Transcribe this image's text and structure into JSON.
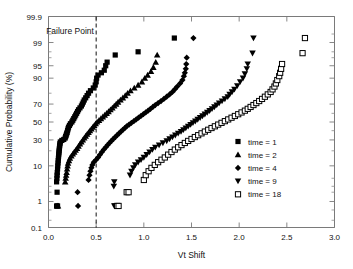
{
  "chart_data": {
    "type": "scatter",
    "title": "",
    "xlabel": "Vt Shift",
    "ylabel": "Cumulative Probability (%)",
    "xlim": [
      0.0,
      3.0
    ],
    "xticks": [
      0.0,
      0.5,
      1.0,
      1.5,
      2.0,
      2.5,
      3.0
    ],
    "xticklabels": [
      "0.0",
      "0.5",
      "1.0",
      "1.5",
      "2.0",
      "2.5",
      "3.0"
    ],
    "yscale": "normal-probability",
    "ylim": [
      0.1,
      99.9
    ],
    "yticks": [
      0.1,
      1,
      10,
      30,
      50,
      70,
      90,
      95,
      99,
      99.9
    ],
    "yticklabels": [
      "0.1",
      "1",
      "10",
      "30",
      "50",
      "70",
      "90",
      "95",
      "99",
      "99.9"
    ],
    "yminorticks": [
      0.2,
      0.5,
      2,
      3,
      5,
      20,
      40,
      60,
      80,
      97,
      98,
      99.5
    ],
    "grid": false,
    "legend_position": "right-lower",
    "annotations": [
      {
        "name": "failure-point",
        "text": "Failure Point",
        "x": 0.5,
        "line": "vertical-dashed",
        "line_style": "dashed"
      }
    ],
    "series": [
      {
        "name": "time = 1",
        "label": "time = 1",
        "marker": "filled-square",
        "color": "#000000",
        "points": [
          [
            0.085,
            0.7
          ],
          [
            0.095,
            0.7
          ],
          [
            0.09,
            2.0
          ],
          [
            0.085,
            4.0
          ],
          [
            0.088,
            5.0
          ],
          [
            0.09,
            6.0
          ],
          [
            0.092,
            7.0
          ],
          [
            0.095,
            8.5
          ],
          [
            0.097,
            10.0
          ],
          [
            0.1,
            11.5
          ],
          [
            0.102,
            13.0
          ],
          [
            0.104,
            14.5
          ],
          [
            0.106,
            16.0
          ],
          [
            0.108,
            17.5
          ],
          [
            0.11,
            19.0
          ],
          [
            0.112,
            20.5
          ],
          [
            0.114,
            22.0
          ],
          [
            0.116,
            23.5
          ],
          [
            0.118,
            25.0
          ],
          [
            0.12,
            26.5
          ],
          [
            0.124,
            28.0
          ],
          [
            0.14,
            29.5
          ],
          [
            0.16,
            30.5
          ],
          [
            0.175,
            32.0
          ],
          [
            0.18,
            33.5
          ],
          [
            0.185,
            35.0
          ],
          [
            0.19,
            36.5
          ],
          [
            0.195,
            38.0
          ],
          [
            0.2,
            40.0
          ],
          [
            0.205,
            42.0
          ],
          [
            0.21,
            44.0
          ],
          [
            0.22,
            46.0
          ],
          [
            0.23,
            48.0
          ],
          [
            0.245,
            50.0
          ],
          [
            0.255,
            52.0
          ],
          [
            0.265,
            54.0
          ],
          [
            0.275,
            56.0
          ],
          [
            0.285,
            58.0
          ],
          [
            0.295,
            60.0
          ],
          [
            0.305,
            62.0
          ],
          [
            0.315,
            64.0
          ],
          [
            0.33,
            66.0
          ],
          [
            0.345,
            68.0
          ],
          [
            0.355,
            70.0
          ],
          [
            0.365,
            72.0
          ],
          [
            0.375,
            74.0
          ],
          [
            0.39,
            76.0
          ],
          [
            0.405,
            78.0
          ],
          [
            0.42,
            80.0
          ],
          [
            0.44,
            82.0
          ],
          [
            0.47,
            84.0
          ],
          [
            0.49,
            86.0
          ],
          [
            0.5,
            88.0
          ],
          [
            0.505,
            90.0
          ],
          [
            0.52,
            91.5
          ],
          [
            0.555,
            92.5
          ],
          [
            0.585,
            93.5
          ],
          [
            0.6,
            95.0
          ],
          [
            0.615,
            96.0
          ],
          [
            0.7,
            97.5
          ],
          [
            0.94,
            98.0
          ],
          [
            1.32,
            99.3
          ]
        ]
      },
      {
        "name": "time = 2",
        "label": "time = 2",
        "marker": "filled-triangle-up",
        "color": "#000000",
        "points": [
          [
            0.09,
            0.7
          ],
          [
            0.1,
            0.7
          ],
          [
            0.175,
            4.0
          ],
          [
            0.18,
            5.0
          ],
          [
            0.185,
            6.0
          ],
          [
            0.19,
            7.0
          ],
          [
            0.195,
            8.5
          ],
          [
            0.2,
            10.0
          ],
          [
            0.205,
            11.5
          ],
          [
            0.215,
            13.0
          ],
          [
            0.225,
            14.5
          ],
          [
            0.24,
            16.0
          ],
          [
            0.255,
            17.5
          ],
          [
            0.27,
            19.0
          ],
          [
            0.285,
            20.5
          ],
          [
            0.3,
            22.0
          ],
          [
            0.315,
            24.0
          ],
          [
            0.33,
            26.0
          ],
          [
            0.345,
            28.0
          ],
          [
            0.36,
            30.0
          ],
          [
            0.375,
            32.0
          ],
          [
            0.39,
            34.0
          ],
          [
            0.405,
            36.0
          ],
          [
            0.42,
            38.0
          ],
          [
            0.435,
            40.0
          ],
          [
            0.45,
            42.0
          ],
          [
            0.465,
            44.0
          ],
          [
            0.48,
            46.0
          ],
          [
            0.495,
            48.0
          ],
          [
            0.51,
            50.0
          ],
          [
            0.53,
            52.0
          ],
          [
            0.55,
            54.0
          ],
          [
            0.57,
            56.0
          ],
          [
            0.59,
            58.0
          ],
          [
            0.61,
            60.0
          ],
          [
            0.63,
            62.0
          ],
          [
            0.65,
            64.0
          ],
          [
            0.67,
            66.0
          ],
          [
            0.69,
            68.0
          ],
          [
            0.71,
            70.0
          ],
          [
            0.73,
            72.0
          ],
          [
            0.755,
            74.0
          ],
          [
            0.78,
            76.0
          ],
          [
            0.805,
            78.0
          ],
          [
            0.83,
            80.0
          ],
          [
            0.86,
            82.0
          ],
          [
            0.9,
            84.0
          ],
          [
            0.94,
            86.0
          ],
          [
            0.98,
            88.0
          ],
          [
            1.01,
            90.0
          ],
          [
            1.04,
            91.5
          ],
          [
            1.075,
            93.0
          ],
          [
            1.1,
            94.5
          ],
          [
            1.125,
            96.0
          ],
          [
            1.14,
            97.5
          ]
        ]
      },
      {
        "name": "time = 4",
        "label": "time = 4",
        "marker": "filled-diamond",
        "color": "#000000",
        "points": [
          [
            0.31,
            0.7
          ],
          [
            0.305,
            2.0
          ],
          [
            0.42,
            4.5
          ],
          [
            0.43,
            6.0
          ],
          [
            0.44,
            7.5
          ],
          [
            0.45,
            9.0
          ],
          [
            0.46,
            10.5
          ],
          [
            0.475,
            12.0
          ],
          [
            0.5,
            13.5
          ],
          [
            0.52,
            15.0
          ],
          [
            0.54,
            17.0
          ],
          [
            0.56,
            19.0
          ],
          [
            0.58,
            21.0
          ],
          [
            0.6,
            23.0
          ],
          [
            0.62,
            25.0
          ],
          [
            0.64,
            27.0
          ],
          [
            0.66,
            29.0
          ],
          [
            0.68,
            31.0
          ],
          [
            0.7,
            33.0
          ],
          [
            0.72,
            35.0
          ],
          [
            0.74,
            37.0
          ],
          [
            0.76,
            39.0
          ],
          [
            0.78,
            41.0
          ],
          [
            0.8,
            43.0
          ],
          [
            0.82,
            45.0
          ],
          [
            0.845,
            47.0
          ],
          [
            0.87,
            49.0
          ],
          [
            0.895,
            51.0
          ],
          [
            0.92,
            53.0
          ],
          [
            0.945,
            55.0
          ],
          [
            0.97,
            57.0
          ],
          [
            0.995,
            59.0
          ],
          [
            1.02,
            61.0
          ],
          [
            1.045,
            63.0
          ],
          [
            1.07,
            65.0
          ],
          [
            1.095,
            67.0
          ],
          [
            1.12,
            69.0
          ],
          [
            1.15,
            71.0
          ],
          [
            1.18,
            73.0
          ],
          [
            1.21,
            75.0
          ],
          [
            1.24,
            77.0
          ],
          [
            1.27,
            79.0
          ],
          [
            1.3,
            81.0
          ],
          [
            1.325,
            83.0
          ],
          [
            1.35,
            85.0
          ],
          [
            1.38,
            87.0
          ],
          [
            1.405,
            89.0
          ],
          [
            1.42,
            91.0
          ],
          [
            1.43,
            92.5
          ],
          [
            1.44,
            94.0
          ],
          [
            1.445,
            95.5
          ],
          [
            1.45,
            97.0
          ],
          [
            1.52,
            99.3
          ]
        ]
      },
      {
        "name": "time = 9",
        "label": "time = 9",
        "marker": "filled-triangle-down",
        "color": "#000000",
        "points": [
          [
            0.69,
            0.7
          ],
          [
            0.7,
            0.7
          ],
          [
            0.685,
            3.0
          ],
          [
            0.69,
            4.0
          ],
          [
            0.855,
            6.0
          ],
          [
            0.87,
            7.5
          ],
          [
            0.89,
            9.0
          ],
          [
            0.91,
            10.5
          ],
          [
            0.94,
            12.0
          ],
          [
            0.97,
            13.5
          ],
          [
            1.0,
            15.0
          ],
          [
            1.03,
            17.0
          ],
          [
            1.06,
            19.0
          ],
          [
            1.09,
            21.0
          ],
          [
            1.12,
            23.0
          ],
          [
            1.16,
            25.0
          ],
          [
            1.2,
            27.0
          ],
          [
            1.24,
            29.0
          ],
          [
            1.27,
            31.0
          ],
          [
            1.3,
            33.0
          ],
          [
            1.33,
            35.0
          ],
          [
            1.36,
            37.0
          ],
          [
            1.39,
            39.0
          ],
          [
            1.415,
            41.0
          ],
          [
            1.44,
            43.0
          ],
          [
            1.465,
            45.0
          ],
          [
            1.49,
            47.0
          ],
          [
            1.515,
            49.0
          ],
          [
            1.54,
            51.0
          ],
          [
            1.565,
            53.0
          ],
          [
            1.59,
            55.0
          ],
          [
            1.615,
            57.0
          ],
          [
            1.64,
            59.0
          ],
          [
            1.665,
            61.0
          ],
          [
            1.69,
            63.0
          ],
          [
            1.715,
            65.0
          ],
          [
            1.74,
            67.0
          ],
          [
            1.765,
            69.0
          ],
          [
            1.79,
            71.0
          ],
          [
            1.82,
            73.0
          ],
          [
            1.85,
            75.0
          ],
          [
            1.88,
            77.0
          ],
          [
            1.9,
            79.0
          ],
          [
            1.925,
            81.0
          ],
          [
            1.95,
            83.0
          ],
          [
            1.98,
            85.5
          ],
          [
            2.01,
            88.0
          ],
          [
            2.04,
            90.0
          ],
          [
            2.06,
            92.0
          ],
          [
            2.08,
            94.0
          ],
          [
            2.09,
            95.5
          ],
          [
            2.14,
            97.8
          ],
          [
            2.15,
            99.3
          ]
        ]
      },
      {
        "name": "time = 18",
        "label": "time = 18",
        "marker": "open-square",
        "color": "#000000",
        "points": [
          [
            0.72,
            0.7
          ],
          [
            0.735,
            0.7
          ],
          [
            0.82,
            2.0
          ],
          [
            0.84,
            2.0
          ],
          [
            1.0,
            4.5
          ],
          [
            1.02,
            6.0
          ],
          [
            1.05,
            7.5
          ],
          [
            1.08,
            9.0
          ],
          [
            1.115,
            10.5
          ],
          [
            1.15,
            12.0
          ],
          [
            1.185,
            13.5
          ],
          [
            1.22,
            15.0
          ],
          [
            1.255,
            17.0
          ],
          [
            1.29,
            19.0
          ],
          [
            1.325,
            21.0
          ],
          [
            1.36,
            23.0
          ],
          [
            1.395,
            25.0
          ],
          [
            1.43,
            27.0
          ],
          [
            1.465,
            29.0
          ],
          [
            1.5,
            31.0
          ],
          [
            1.535,
            33.0
          ],
          [
            1.57,
            35.0
          ],
          [
            1.605,
            37.0
          ],
          [
            1.64,
            39.0
          ],
          [
            1.675,
            41.0
          ],
          [
            1.71,
            43.0
          ],
          [
            1.745,
            45.0
          ],
          [
            1.78,
            47.0
          ],
          [
            1.815,
            49.0
          ],
          [
            1.85,
            51.0
          ],
          [
            1.885,
            53.0
          ],
          [
            1.92,
            55.0
          ],
          [
            1.955,
            57.0
          ],
          [
            1.99,
            59.0
          ],
          [
            2.025,
            61.0
          ],
          [
            2.06,
            63.0
          ],
          [
            2.09,
            65.0
          ],
          [
            2.12,
            67.0
          ],
          [
            2.15,
            69.0
          ],
          [
            2.18,
            71.0
          ],
          [
            2.21,
            73.0
          ],
          [
            2.24,
            75.0
          ],
          [
            2.27,
            77.0
          ],
          [
            2.3,
            79.0
          ],
          [
            2.33,
            81.0
          ],
          [
            2.35,
            83.0
          ],
          [
            2.37,
            85.0
          ],
          [
            2.385,
            87.0
          ],
          [
            2.4,
            89.0
          ],
          [
            2.42,
            91.0
          ],
          [
            2.43,
            92.5
          ],
          [
            2.44,
            94.0
          ],
          [
            2.45,
            95.5
          ],
          [
            2.665,
            97.8
          ],
          [
            2.69,
            99.3
          ]
        ]
      }
    ]
  },
  "legend": {
    "entries": [
      {
        "label": "time = 1",
        "marker": "filled-square"
      },
      {
        "label": "time = 2",
        "marker": "filled-triangle-up"
      },
      {
        "label": "time = 4",
        "marker": "filled-diamond"
      },
      {
        "label": "time = 9",
        "marker": "filled-triangle-down"
      },
      {
        "label": "time = 18",
        "marker": "open-square"
      }
    ]
  },
  "colors": {
    "marker": "#000000",
    "axis": "#7a7a7a",
    "text": "#111111",
    "background": "#ffffff"
  }
}
